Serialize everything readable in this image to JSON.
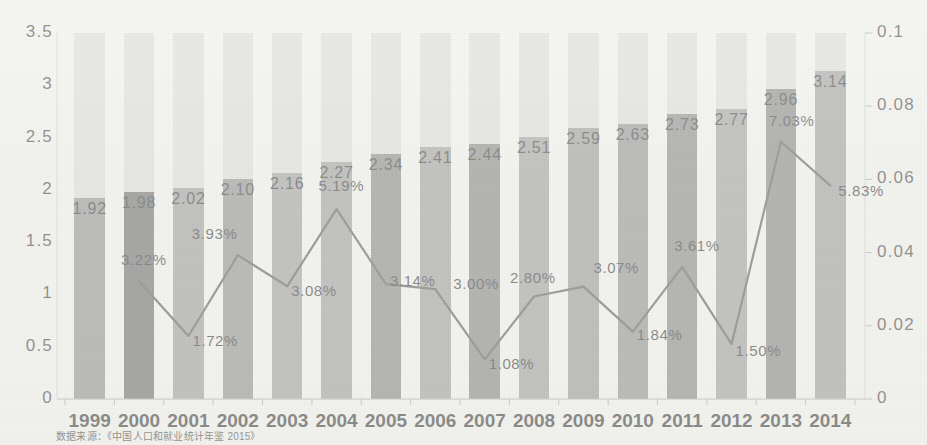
{
  "chart_data": {
    "type": "bar",
    "title": "",
    "subtitle": "",
    "xlabel": "",
    "ylabel": "",
    "categories": [
      "1999",
      "2000",
      "2001",
      "2002",
      "2003",
      "2004",
      "2005",
      "2006",
      "2007",
      "2008",
      "2009",
      "2010",
      "2011",
      "2012",
      "2013",
      "2014"
    ],
    "series": [
      {
        "name": "bar",
        "axis": "left",
        "type": "bar",
        "values": [
          1.92,
          1.98,
          2.02,
          2.1,
          2.16,
          2.27,
          2.34,
          2.41,
          2.44,
          2.51,
          2.59,
          2.63,
          2.73,
          2.77,
          2.96,
          3.14
        ],
        "labels": [
          "1.92",
          "1.98",
          "2.02",
          "2.10",
          "2.16",
          "2.27",
          "2.34",
          "2.41",
          "2.44",
          "2.51",
          "2.59",
          "2.63",
          "2.73",
          "2.77",
          "2.96",
          "3.14"
        ]
      },
      {
        "name": "line",
        "axis": "right",
        "type": "line",
        "x": [
          "2000",
          "2001",
          "2002",
          "2003",
          "2004",
          "2005",
          "2006",
          "2007",
          "2008",
          "2009",
          "2010",
          "2011",
          "2012",
          "2013",
          "2014"
        ],
        "values": [
          0.0322,
          0.0172,
          0.0393,
          0.0308,
          0.0519,
          0.0314,
          0.03,
          0.0108,
          0.028,
          0.0307,
          0.0184,
          0.0361,
          0.015,
          0.0703,
          0.0583
        ],
        "labels": [
          "3.22%",
          "1.72%",
          "3.93%",
          "3.08%",
          "5.19%",
          "3.14%",
          "3.00%",
          "1.08%",
          "2.80%",
          "3.07%",
          "1.84%",
          "3.61%",
          "1.50%",
          "7.03%",
          "5.83%"
        ]
      }
    ],
    "ylim": [
      0,
      3.5
    ],
    "yticks": [
      "0",
      "0.5",
      "1",
      "1.5",
      "2",
      "2.5",
      "3",
      "3.5"
    ],
    "y2lim": [
      0,
      0.1
    ],
    "y2ticks": [
      "0",
      "0.02",
      "0.04",
      "0.06",
      "0.08",
      "0.1"
    ],
    "grid": false,
    "legend": "none",
    "bar_track_color": "#d9d9d9",
    "bar_colors": [
      "#7c7c7c",
      "#4e4e4e",
      "#8a8a8a",
      "#7a7a7a",
      "#8c8c8c",
      "#8b8b8b",
      "#6e6e6e",
      "#8b8b8b",
      "#6c6c6c",
      "#8c8c8c",
      "#848484",
      "#7b7b7b",
      "#6f6f6f",
      "#8d8d8d",
      "#6b6b6b",
      "#8a8a8a"
    ],
    "line_color": "#3a3a3a"
  },
  "footnote": {
    "text": "数据来源：《中国人口和就业统计年鉴 2015》"
  }
}
